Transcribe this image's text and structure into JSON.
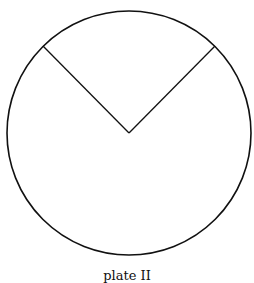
{
  "figure": {
    "caption": "plate II",
    "circle": {
      "cx": 129,
      "cy": 133,
      "r": 122,
      "stroke": "#111111"
    },
    "sector_lines": [
      {
        "x1": 129,
        "y1": 133,
        "x2": 43,
        "y2": 46
      },
      {
        "x1": 129,
        "y1": 133,
        "x2": 215,
        "y2": 46
      }
    ]
  }
}
